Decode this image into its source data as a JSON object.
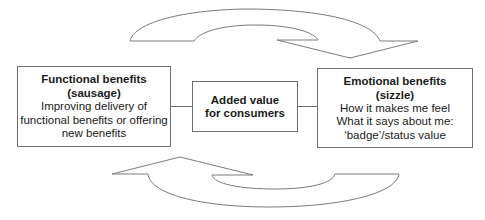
{
  "diagram": {
    "left_box": {
      "title": "Functional benefits (sausage)",
      "lines": [
        "Improving delivery of",
        "functional benefits or offering",
        "new benefits"
      ]
    },
    "center_box": {
      "title": "Added value for consumers"
    },
    "right_box": {
      "title": "Emotional benefits (sizzle)",
      "lines": [
        "How it makes me feel",
        "What it says about me:",
        "‘badge’/status value"
      ]
    },
    "arrows": [
      {
        "from": "left_box",
        "to": "right_box",
        "position": "top",
        "style": "curved-outline"
      },
      {
        "from": "right_box",
        "to": "left_box",
        "position": "bottom",
        "style": "curved-outline"
      }
    ],
    "colors": {
      "stroke": "#6e6e6e",
      "text": "#1a1a1a",
      "background": "#ffffff"
    }
  }
}
